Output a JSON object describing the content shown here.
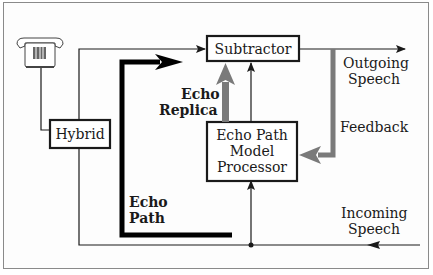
{
  "diagram": {
    "blocks": {
      "hybrid": "Hybrid",
      "subtractor": "Subtractor",
      "processor_line1": "Echo Path",
      "processor_line2": "Model",
      "processor_line3": "Processor"
    },
    "labels": {
      "outgoing_line1": "Outgoing",
      "outgoing_line2": "Speech",
      "incoming_line1": "Incoming",
      "incoming_line2": "Speech",
      "feedback": "Feedback",
      "echo_replica_line1": "Echo",
      "echo_replica_line2": "Replica",
      "echo_path_line1": "Echo",
      "echo_path_line2": "Path"
    },
    "icons": {
      "telephone": "telephone-icon"
    },
    "colors": {
      "line": "#1a1a1a",
      "gray_arrow": "#7a7a7a",
      "frame": "#8a8a8a"
    }
  }
}
